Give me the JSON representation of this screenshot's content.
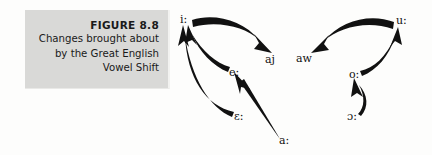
{
  "figure": {
    "number": "FIGURE 8.8",
    "caption_lines": [
      "Changes brought about",
      "by the Great English",
      "Vowel Shift"
    ],
    "panel_color": "#d9d9d7",
    "ink_color": "#111111"
  },
  "diagram": {
    "title": "Great English Vowel Shift",
    "vowels": [
      {
        "id": "i-long",
        "label": "i:",
        "x": 180,
        "y": 14
      },
      {
        "id": "e-long",
        "label": "e:",
        "x": 229,
        "y": 67
      },
      {
        "id": "epsilon-long",
        "label": "ɛ:",
        "x": 234,
        "y": 111
      },
      {
        "id": "a-long",
        "label": "a:",
        "x": 279,
        "y": 135
      },
      {
        "id": "aj",
        "label": "aj",
        "x": 265,
        "y": 54
      },
      {
        "id": "aw",
        "label": "aw",
        "x": 296,
        "y": 53
      },
      {
        "id": "u-long",
        "label": "u:",
        "x": 396,
        "y": 15
      },
      {
        "id": "o-long",
        "label": "o:",
        "x": 349,
        "y": 69
      },
      {
        "id": "open-o-long",
        "label": "ɔ:",
        "x": 347,
        "y": 111
      }
    ],
    "shifts": [
      {
        "id": "i-to-aj",
        "from": "i:",
        "to": "aj"
      },
      {
        "id": "e-to-i",
        "from": "e:",
        "to": "i:"
      },
      {
        "id": "epsilon-to-i",
        "from": "ɛ:",
        "to": "i:"
      },
      {
        "id": "a-to-e",
        "from": "a:",
        "to": "e:"
      },
      {
        "id": "u-to-aw",
        "from": "u:",
        "to": "aw"
      },
      {
        "id": "o-to-u",
        "from": "o:",
        "to": "u:"
      },
      {
        "id": "open-o-to-o",
        "from": "ɔ:",
        "to": "o:"
      }
    ]
  }
}
